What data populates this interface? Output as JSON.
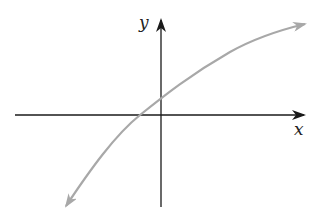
{
  "diagram": {
    "type": "function-graph",
    "axes": {
      "x_label": "x",
      "y_label": "y",
      "color": "#1a1a1a"
    },
    "curve": {
      "color": "#a8a8a8",
      "shape": "increasing, concave down (logarithmic-like)",
      "x_intercept": "negative",
      "y_intercept": "positive",
      "arrows": [
        "lower-left",
        "upper-right"
      ]
    }
  }
}
